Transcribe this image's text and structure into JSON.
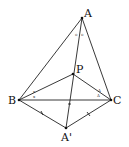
{
  "diagram": {
    "type": "geometry",
    "points": {
      "A": {
        "label": "A",
        "x": 82,
        "y": 18
      },
      "P": {
        "label": "P",
        "x": 73,
        "y": 74
      },
      "B": {
        "label": "B",
        "x": 19,
        "y": 100
      },
      "C": {
        "label": "C",
        "x": 111,
        "y": 100
      },
      "A2": {
        "label": "A'",
        "x": 66,
        "y": 128
      }
    },
    "segments": [
      "AB",
      "AC",
      "AA'",
      "BC",
      "BP",
      "CP",
      "BA'",
      "CA'"
    ],
    "angle_marks": {
      "at_A": "o",
      "at_B": "x",
      "at_C": "Δ"
    }
  }
}
